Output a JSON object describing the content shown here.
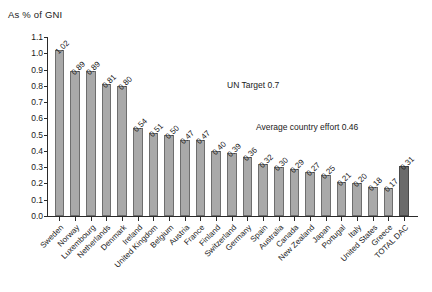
{
  "title": "As % of GNI",
  "annotations": {
    "un_target": "UN Target 0.7",
    "average_effort": "Average country effort 0.46"
  },
  "colors": {
    "bar_fill": "#a9a9a9",
    "bar_stroke": "#6e6e6e",
    "total_fill": "#6b6b6b",
    "total_stroke": "#4a4a4a",
    "axis": "#2a2a2a",
    "text": "#1a1a1a"
  },
  "chart_data": {
    "type": "bar",
    "title": "As % of GNI",
    "xlabel": "",
    "ylabel": "As % of GNI",
    "ylim": [
      0.0,
      1.1
    ],
    "ytick_labels": [
      "0.0",
      "0.1",
      "0.2",
      "0.3",
      "0.4",
      "0.5",
      "0.6",
      "0.7",
      "0.8",
      "0.9",
      "1.0",
      "1.1"
    ],
    "ytick_values": [
      0.0,
      0.1,
      0.2,
      0.3,
      0.4,
      0.5,
      0.6,
      0.7,
      0.8,
      0.9,
      1.0,
      1.1
    ],
    "grid": false,
    "legend": "none",
    "categories": [
      "Sweden",
      "Norway",
      "Luxembourg",
      "Netherlands",
      "Denmark",
      "Ireland",
      "United Kingdom",
      "Belgium",
      "Austria",
      "France",
      "Finland",
      "Switzerland",
      "Germany",
      "Spain",
      "Australia",
      "Canada",
      "New Zealand",
      "Japan",
      "Portugal",
      "Italy",
      "United States",
      "Greece",
      "TOTAL DAC"
    ],
    "values": [
      1.02,
      0.89,
      0.89,
      0.81,
      0.8,
      0.54,
      0.51,
      0.5,
      0.47,
      0.47,
      0.4,
      0.39,
      0.36,
      0.32,
      0.3,
      0.29,
      0.27,
      0.25,
      0.21,
      0.2,
      0.18,
      0.17,
      0.31
    ],
    "value_labels": [
      "1.02",
      "0.89",
      "0.89",
      "0.81",
      "0.80",
      "0.54",
      "0.51",
      "0.50",
      "0.47",
      "0.47",
      "0.40",
      "0.39",
      "0.36",
      "0.32",
      "0.30",
      "0.29",
      "0.27",
      "0.25",
      "0.21",
      "0.20",
      "0.18",
      "0.17",
      "0.31"
    ],
    "highlight_index": 22,
    "annotations": [
      {
        "text": "UN Target 0.7",
        "value": 0.7
      },
      {
        "text": "Average country effort 0.46",
        "value": 0.46
      }
    ]
  }
}
